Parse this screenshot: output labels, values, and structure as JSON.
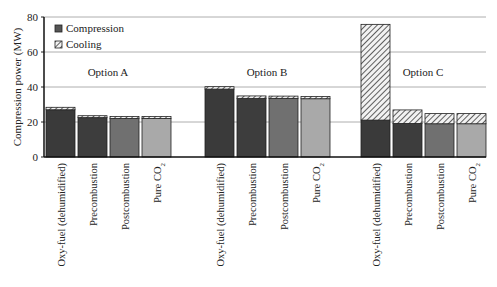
{
  "chart_data": {
    "type": "bar",
    "stacked": true,
    "title": "",
    "xlabel": "",
    "ylabel": "Compression power (MW)",
    "ylim": [
      0,
      80
    ],
    "yticks": [
      0,
      20,
      40,
      60,
      80
    ],
    "grid": true,
    "legend": {
      "position": "upper-left",
      "entries": [
        {
          "name": "Compression",
          "style": "solid-dark"
        },
        {
          "name": "Cooling",
          "style": "hatched"
        }
      ]
    },
    "groups": [
      {
        "label": "Option A",
        "categories": [
          "Oxy-fuel (dehumidified)",
          "Precombustion",
          "Postcombustion",
          "Pure CO2"
        ],
        "series": [
          {
            "name": "Compression",
            "values": [
              27,
              22.5,
              22,
              22
            ]
          },
          {
            "name": "Cooling",
            "values": [
              1.4,
              1.1,
              1.2,
              1.2
            ]
          }
        ]
      },
      {
        "label": "Option B",
        "categories": [
          "Oxy-fuel (dehumidified)",
          "Precombustion",
          "Postcombustion",
          "Pure CO2"
        ],
        "series": [
          {
            "name": "Compression",
            "values": [
              38.8,
              33.5,
              33.5,
              33.3
            ]
          },
          {
            "name": "Cooling",
            "values": [
              1.4,
              1.4,
              1.3,
              1.3
            ]
          }
        ]
      },
      {
        "label": "Option C",
        "categories": [
          "Oxy-fuel (dehumidified)",
          "Precombustion",
          "Postcombustion",
          "Pure CO2"
        ],
        "series": [
          {
            "name": "Compression",
            "values": [
              21.1,
              19.2,
              19,
              19
            ]
          },
          {
            "name": "Cooling",
            "values": [
              54.7,
              7.7,
              5.8,
              5.8
            ]
          }
        ]
      }
    ],
    "bar_colors": [
      "#3a3a3a",
      "#3d3d3d",
      "#707070",
      "#a9a9a9"
    ]
  },
  "labels": {
    "ylabel": "Compression power (MW)",
    "legend_compression": "Compression",
    "legend_cooling": "Cooling"
  }
}
